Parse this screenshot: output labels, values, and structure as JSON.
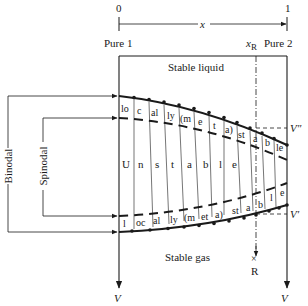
{
  "axis": {
    "start_label": "0",
    "end_label": "1",
    "variable": "x",
    "left_component": "Pure 1",
    "right_component": "Pure 2",
    "marker_label": "x",
    "marker_subscript": "R"
  },
  "regions": {
    "top": "Stable liquid",
    "middle": "Unstable",
    "bottom": "Stable gas"
  },
  "curves": {
    "binodal_label": "Binodal",
    "spinodal_label": "Spinodal",
    "v_double_prime": "V″",
    "v_prime": "V′"
  },
  "upper_metastable_segments": [
    "lo",
    "c",
    "al",
    "ly",
    "(m",
    "e",
    "t",
    "a)",
    "st",
    "a",
    "b",
    "le"
  ],
  "lower_metastable_segments": [
    "l",
    "oc",
    "al",
    "ly",
    "(m",
    "et",
    "a)",
    "st",
    "a",
    "b",
    "l",
    "e"
  ],
  "unstable_letters": [
    "U",
    "n",
    "s",
    "t",
    "a",
    "b",
    "l",
    "e"
  ],
  "point_R": {
    "label": "R",
    "mark": "×"
  },
  "bottom_axis": {
    "left_label": "V",
    "right_label": "V"
  },
  "colors": {
    "ink": "#1a1a1a",
    "background": "#ffffff"
  }
}
